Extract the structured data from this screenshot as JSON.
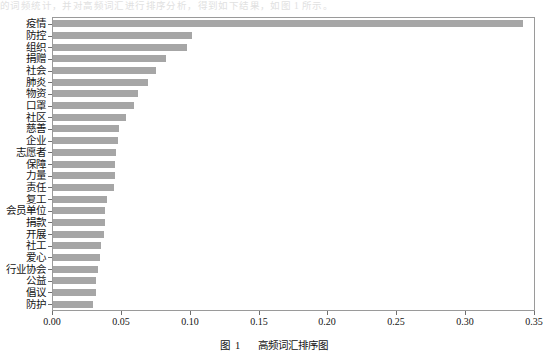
{
  "page": {
    "top_bleed_text": "的词频统计，并对高频词汇进行排序分析，得到如下结果，如图 1 所示。"
  },
  "caption": {
    "prefix": "图",
    "number": "1",
    "title": "高频词汇排序图"
  },
  "style": {
    "bar_color": "#a6a6a6",
    "frame_color": "#9a9a9a",
    "text_color": "#141414"
  },
  "chart_data": {
    "type": "bar",
    "orientation": "horizontal",
    "title": "",
    "xlabel": "",
    "ylabel": "",
    "xlim": [
      0.0,
      0.35
    ],
    "ylim": null,
    "grid": false,
    "legend": null,
    "xticks": [
      0.0,
      0.05,
      0.1,
      0.15,
      0.2,
      0.25,
      0.3,
      0.35
    ],
    "xtick_labels": [
      "0.00",
      "0.05",
      "0.10",
      "0.15",
      "0.20",
      "0.25",
      "0.30",
      "0.35"
    ],
    "categories": [
      "疫情",
      "防控",
      "组织",
      "捐赠",
      "社会",
      "肺炎",
      "物资",
      "口罩",
      "社区",
      "慈善",
      "企业",
      "志愿者",
      "保障",
      "力量",
      "责任",
      "复工",
      "会员单位",
      "捐款",
      "开展",
      "社工",
      "爱心",
      "行业协会",
      "公益",
      "倡议",
      "防护"
    ],
    "values": [
      0.341,
      0.101,
      0.097,
      0.082,
      0.075,
      0.069,
      0.062,
      0.059,
      0.053,
      0.048,
      0.047,
      0.046,
      0.045,
      0.045,
      0.044,
      0.039,
      0.038,
      0.038,
      0.037,
      0.035,
      0.034,
      0.033,
      0.031,
      0.031,
      0.029
    ]
  }
}
